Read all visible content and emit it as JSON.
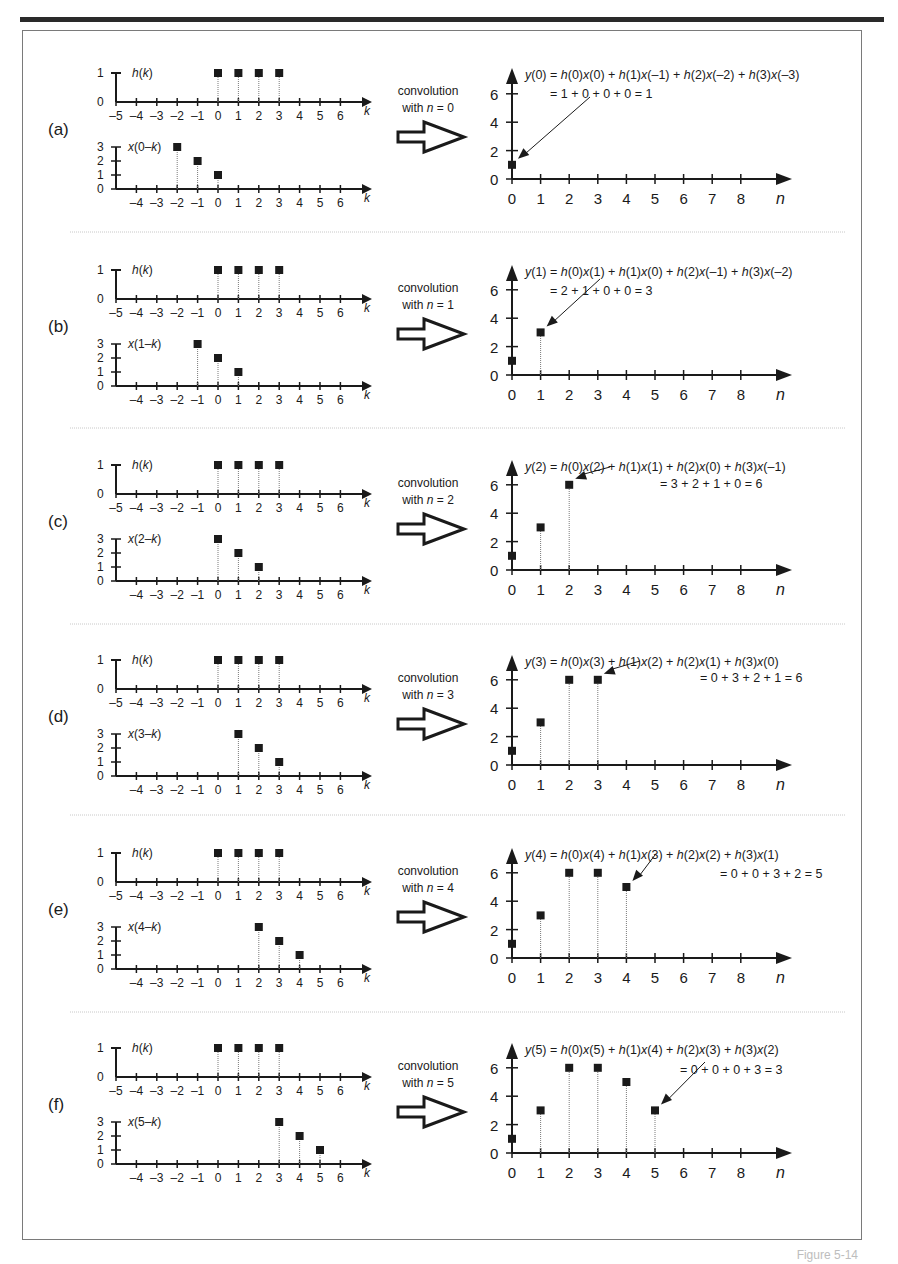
{
  "figure": {
    "footer_label": "Figure 5-14",
    "k_ticks_top": [
      -5,
      -4,
      -3,
      -2,
      -1,
      0,
      1,
      2,
      3,
      4,
      5,
      6
    ],
    "k_ticks_bottom": [
      -4,
      -3,
      -2,
      -1,
      0,
      1,
      2,
      3,
      4,
      5,
      6
    ],
    "n_ticks": [
      0,
      1,
      2,
      3,
      4,
      5,
      6,
      7,
      8
    ],
    "y_ticks": [
      0,
      2,
      4,
      6
    ],
    "x_axis_label_k": "k",
    "x_axis_label_n": "n",
    "h_label": "h(k)",
    "h_values": {
      "0": 1,
      "1": 1,
      "2": 1,
      "3": 1
    },
    "conv_line1": "convolution",
    "panels": [
      {
        "letter": "(a)",
        "n": 0,
        "x_label": "x(0–k)",
        "conv_line2": "with n = 0",
        "x_shifted": {
          "-2": 3,
          "-1": 2,
          "0": 1
        },
        "eq1": "y(0) = h(0)x(0) + h(1)x(–1) + h(2)x(–2) + h(3)x(–3)",
        "eq2": "= 1 + 0 + 0 + 0 = 1"
      },
      {
        "letter": "(b)",
        "n": 1,
        "x_label": "x(1–k)",
        "conv_line2": "with n = 1",
        "x_shifted": {
          "-1": 3,
          "0": 2,
          "1": 1
        },
        "eq1": "y(1) = h(0)x(1) + h(1)x(0) + h(2)x(–1) + h(3)x(–2)",
        "eq2": "= 2 + 1 + 0 + 0 = 3"
      },
      {
        "letter": "(c)",
        "n": 2,
        "x_label": "x(2–k)",
        "conv_line2": "with n = 2",
        "x_shifted": {
          "0": 3,
          "1": 2,
          "2": 1
        },
        "eq1": "y(2) = h(0)x(2) + h(1)x(1) + h(2)x(0) + h(3)x(–1)",
        "eq2": "= 3 + 2 + 1 + 0 = 6"
      },
      {
        "letter": "(d)",
        "n": 3,
        "x_label": "x(3–k)",
        "conv_line2": "with n = 3",
        "x_shifted": {
          "1": 3,
          "2": 2,
          "3": 1
        },
        "eq1": "y(3) = h(0)x(3) + h(1)x(2) + h(2)x(1) + h(3)x(0)",
        "eq2": "= 0 + 3 + 2 + 1 = 6"
      },
      {
        "letter": "(e)",
        "n": 4,
        "x_label": "x(4–k)",
        "conv_line2": "with n = 4",
        "x_shifted": {
          "2": 3,
          "3": 2,
          "4": 1
        },
        "eq1": "y(4) = h(0)x(4) + h(1)x(3) + h(2)x(2) + h(3)x(1)",
        "eq2": "= 0 + 0 + 3 + 2 = 5"
      },
      {
        "letter": "(f)",
        "n": 5,
        "x_label": "x(5–k)",
        "conv_line2": "with n = 5",
        "x_shifted": {
          "3": 3,
          "4": 2,
          "5": 1
        },
        "eq1": "y(5) = h(0)x(5) + h(1)x(4) + h(2)x(3) + h(3)x(2)",
        "eq2": "= 0 + 0 + 0 + 3 = 3"
      }
    ]
  },
  "chart_data": [
    {
      "type": "scatter",
      "title": "h(k)",
      "xlabel": "k",
      "ylabel": "h(k)",
      "x": [
        0,
        1,
        2,
        3
      ],
      "y": [
        1,
        1,
        1,
        1
      ],
      "xlim": [
        -5,
        6
      ],
      "ylim": [
        0,
        1
      ]
    },
    {
      "type": "scatter",
      "title": "y(n) convolution output",
      "xlabel": "n",
      "ylabel": "y(n)",
      "x": [
        0,
        1,
        2,
        3,
        4,
        5
      ],
      "y": [
        1,
        3,
        6,
        6,
        5,
        3
      ],
      "xlim": [
        0,
        8
      ],
      "ylim": [
        0,
        6
      ]
    }
  ],
  "colors": {
    "ink": "#1a1a1a",
    "stem": "#7a7a7a",
    "frame": "#7a7a7a",
    "separator": "#c8c8c8"
  }
}
